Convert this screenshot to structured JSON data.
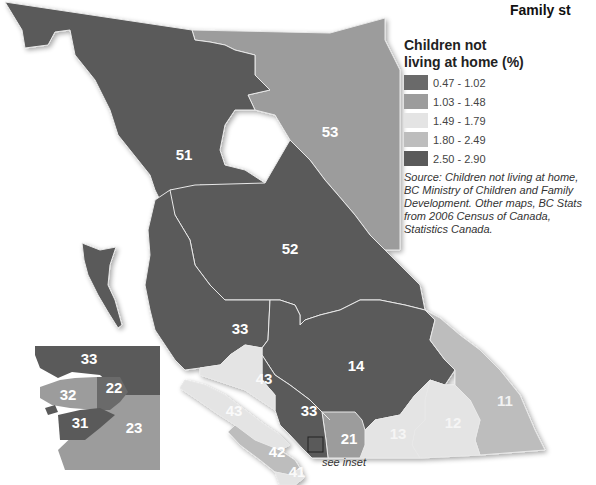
{
  "title": "Family st",
  "legend": {
    "title_line1": "Children not",
    "title_line2": "living at home (%)",
    "classes": [
      {
        "label": "0.47 - 1.02",
        "color": "#6a6a6a"
      },
      {
        "label": "1.03 - 1.48",
        "color": "#9c9c9c"
      },
      {
        "label": "1.49 - 1.79",
        "color": "#e4e4e4"
      },
      {
        "label": "1.80 - 2.49",
        "color": "#bdbdbd"
      },
      {
        "label": "2.50 - 2.90",
        "color": "#5a5a5a"
      }
    ]
  },
  "source": "Source: Children not living at home, BC Ministry of Children and Family Development.  Other maps, BC Stats from 2006 Census of Canada, Statistics Canada.",
  "map": {
    "regions": [
      {
        "id": "51",
        "class": "2.50 - 2.90"
      },
      {
        "id": "52",
        "class": "2.50 - 2.90"
      },
      {
        "id": "53",
        "class": "1.03 - 1.48"
      },
      {
        "id": "33",
        "class": "2.50 - 2.90"
      },
      {
        "id": "14",
        "class": "2.50 - 2.90"
      },
      {
        "id": "11",
        "class": "1.80 - 2.49"
      },
      {
        "id": "12",
        "class": "1.49 - 1.79"
      },
      {
        "id": "13",
        "class": "1.49 - 1.79"
      },
      {
        "id": "21",
        "class": "1.03 - 1.48"
      },
      {
        "id": "43",
        "class": "1.49 - 1.79"
      },
      {
        "id": "42",
        "class": "1.80 - 2.49"
      },
      {
        "id": "41",
        "class": "1.49 - 1.79"
      }
    ],
    "labels": {
      "r51": "51",
      "r52": "52",
      "r53": "53",
      "r33a": "33",
      "r14": "14",
      "r11": "11",
      "r12": "12",
      "r13": "13",
      "r21": "21",
      "r33b": "33",
      "r43a": "43",
      "r43b": "43",
      "r42": "42",
      "r41": "41"
    },
    "see_inset": "see inset"
  },
  "inset": {
    "regions": [
      {
        "id": "33",
        "class": "2.50 - 2.90"
      },
      {
        "id": "22",
        "class": "0.47 - 1.02"
      },
      {
        "id": "32",
        "class": "1.03 - 1.48"
      },
      {
        "id": "31",
        "class": "2.50 - 2.90"
      },
      {
        "id": "23",
        "class": "1.03 - 1.48"
      }
    ],
    "labels": {
      "r33": "33",
      "r22": "22",
      "r32": "32",
      "r31": "31",
      "r23": "23"
    }
  }
}
